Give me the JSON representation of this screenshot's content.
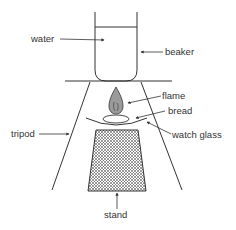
{
  "diagram": {
    "labels": {
      "water": "water",
      "beaker": "beaker",
      "flame": "flame",
      "bread": "bread",
      "watch_glass": "watch glass",
      "tripod": "tripod",
      "stand": "stand"
    },
    "colors": {
      "line": "#333333",
      "flame_fill": "#9a9a9a",
      "hatch": "#555555",
      "background": "#ffffff"
    }
  }
}
